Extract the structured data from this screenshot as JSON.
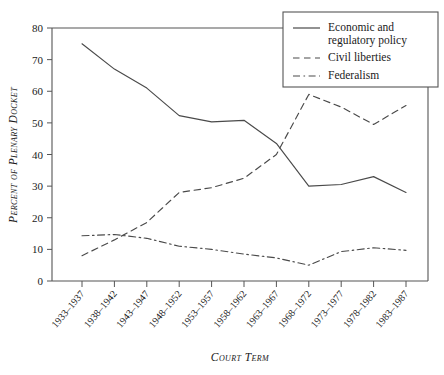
{
  "chart_data": {
    "type": "line",
    "title": "",
    "xlabel": "Court Term",
    "ylabel": "Percent of Plenary Docket",
    "ylim": [
      0,
      80
    ],
    "yticks": [
      0,
      10,
      20,
      30,
      40,
      50,
      60,
      70,
      80
    ],
    "grid": false,
    "legend_position": "top-right",
    "categories": [
      "1933–1937",
      "1938–1942",
      "1943–1947",
      "1948–1952",
      "1953–1957",
      "1958–1962",
      "1963–1967",
      "1968–1972",
      "1973–1977",
      "1978–1982",
      "1983–1987"
    ],
    "series": [
      {
        "name": "Economic and regulatory policy",
        "style": "solid",
        "values": [
          75,
          67,
          61,
          52.3,
          50.3,
          50.8,
          43.5,
          30,
          30.5,
          33,
          28
        ]
      },
      {
        "name": "Civil liberties",
        "style": "dashed",
        "values": [
          8,
          13,
          18.5,
          28,
          29.5,
          32.5,
          40,
          59,
          55,
          49.5,
          55.5
        ]
      },
      {
        "name": "Federalism",
        "style": "dash-dot",
        "values": [
          14.3,
          14.7,
          13.5,
          11,
          10,
          8.5,
          7.3,
          5,
          9.3,
          10.5,
          9.7
        ]
      }
    ]
  },
  "legend": {
    "entries": [
      {
        "label_line1": "Economic and",
        "label_line2": "regulatory policy"
      },
      {
        "label_line1": "Civil liberties",
        "label_line2": ""
      },
      {
        "label_line1": "Federalism",
        "label_line2": ""
      }
    ]
  },
  "axes": {
    "y_title": "Percent of Plenary Docket",
    "x_title": "Court Term",
    "y_tick_labels": [
      "0",
      "10",
      "20",
      "30",
      "40",
      "50",
      "60",
      "70",
      "80"
    ],
    "x_tick_labels": [
      "1933–1937",
      "1938–1942",
      "1943–1947",
      "1948–1952",
      "1953–1957",
      "1958–1962",
      "1963–1967",
      "1968–1972",
      "1973–1977",
      "1978–1982",
      "1983–1987"
    ]
  },
  "colors": {
    "line": "#4a4a4a",
    "axis": "#555555",
    "text": "#1a1a1a",
    "background": "#ffffff"
  }
}
